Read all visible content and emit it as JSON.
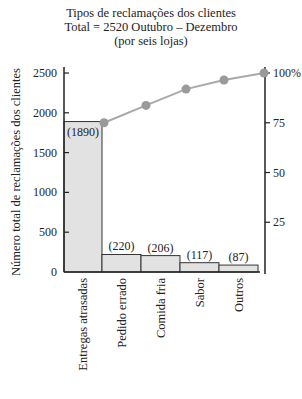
{
  "chart_data": {
    "type": "bar",
    "title": "Tipos de reclamações dos clientes",
    "subtitle": "Total = 2520 Outubro – Dezembro",
    "subtitle2": "(por seis lojas)",
    "xlabel": "",
    "ylabel": "Número total de reclamações dos clientes",
    "ylabel_right": "",
    "categories": [
      "Entregas atrasadas",
      "Pedido errado",
      "Comida fria",
      "Sabor",
      "Outros"
    ],
    "values": [
      1890,
      220,
      206,
      117,
      87
    ],
    "value_labels": [
      "(1890)",
      "(220)",
      "(206)",
      "(117)",
      "(87)"
    ],
    "cumulative_percent": [
      75.0,
      83.7,
      91.9,
      96.5,
      100.0
    ],
    "ylim": [
      0,
      2500
    ],
    "yticks": [
      0,
      500,
      1000,
      1500,
      2000,
      2500
    ],
    "ylim_right": [
      0,
      100
    ],
    "yticks_right": [
      25,
      50,
      75,
      100
    ],
    "ytick_right_labels": [
      "25",
      "50",
      "75",
      "100%"
    ],
    "series": [
      {
        "name": "Número de reclamações",
        "type": "bar",
        "values": [
          1890,
          220,
          206,
          117,
          87
        ]
      },
      {
        "name": "Percentual acumulado",
        "type": "line",
        "values": [
          75.0,
          83.7,
          91.9,
          96.5,
          100.0
        ]
      }
    ],
    "grid": false,
    "legend": "none",
    "colors": {
      "bar_fill": "#e2e2e2",
      "bar_stroke": "#333333",
      "line": "#a9a9a9",
      "marker": "#9a9a9a",
      "axis": "#222222"
    }
  }
}
